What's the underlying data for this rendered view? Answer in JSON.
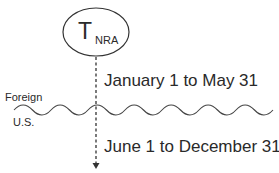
{
  "node": {
    "main": "T",
    "subscript": "NRA"
  },
  "regions": {
    "top": "Foreign",
    "bottom": "U.S."
  },
  "periods": {
    "first": "January 1 to May 31",
    "second": "June 1 to December 31"
  },
  "colors": {
    "stroke": "#333333",
    "text": "#2a2a2a",
    "background": "#ffffff"
  }
}
